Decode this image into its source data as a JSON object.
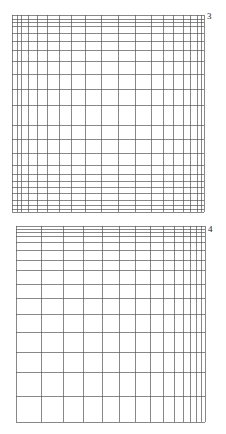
{
  "figures": [
    {
      "label": "3",
      "label_pos": [
        207,
        19
      ],
      "bounds": {
        "left": 12,
        "right": 204,
        "top": 15,
        "bottom": 212
      },
      "vertical_lines": [
        12,
        17,
        21,
        28,
        37,
        47,
        59,
        71,
        85,
        101,
        118,
        135,
        151,
        163,
        173,
        183,
        190,
        197,
        201,
        204
      ],
      "horizontal_lines": [
        15,
        19,
        22,
        26,
        33,
        41,
        50,
        61,
        74,
        89,
        105,
        125,
        139,
        153,
        165,
        174,
        181,
        187,
        193,
        200,
        205,
        209,
        212
      ]
    },
    {
      "label": "4",
      "label_pos": [
        208,
        232
      ],
      "bounds": {
        "left": 16,
        "right": 205,
        "top": 226,
        "bottom": 422
      },
      "vertical_lines": [
        16,
        41,
        63,
        83,
        102,
        119,
        135,
        150,
        163,
        174,
        183,
        190,
        196,
        201,
        205
      ],
      "horizontal_lines": [
        226,
        229,
        232,
        236,
        242,
        250,
        260,
        270,
        284,
        298,
        314,
        332,
        352,
        372,
        396,
        422
      ]
    }
  ],
  "colors": {
    "line": "#555555",
    "background": "#ffffff",
    "text": "#222222"
  }
}
